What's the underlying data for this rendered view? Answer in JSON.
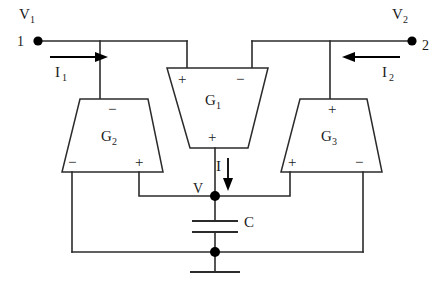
{
  "diagram": {
    "background_color": "#ffffff",
    "line_color": "#2b2b2b",
    "ports": [
      {
        "id": "port-1",
        "voltage_label": "V",
        "voltage_sub": "1",
        "terminal_label": "1",
        "current_label": "I",
        "current_sub": "1",
        "current_direction": "right"
      },
      {
        "id": "port-2",
        "voltage_label": "V",
        "voltage_sub": "2",
        "terminal_label": "2",
        "current_label": "I",
        "current_sub": "2",
        "current_direction": "left"
      }
    ],
    "amplifiers": [
      {
        "id": "g1",
        "label": "G",
        "sub": "1",
        "orientation": "wide-top",
        "terminals": {
          "top_left": "+",
          "top_right": "−",
          "bottom": "+"
        }
      },
      {
        "id": "g2",
        "label": "G",
        "sub": "2",
        "orientation": "wide-bottom",
        "terminals": {
          "top": "−",
          "bottom_left": "−",
          "bottom_right": "+"
        }
      },
      {
        "id": "g3",
        "label": "G",
        "sub": "3",
        "orientation": "wide-bottom",
        "terminals": {
          "top": "+",
          "bottom_left": "+",
          "bottom_right": "−"
        }
      }
    ],
    "capacitor": {
      "label": "C"
    },
    "output_node": {
      "label": "V"
    },
    "output_current": {
      "label": "I",
      "direction": "down"
    }
  }
}
